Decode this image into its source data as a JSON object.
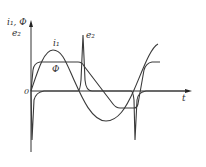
{
  "diagram": {
    "type": "waveform",
    "y_axis_label_line1": "i₁, Φ",
    "y_axis_label_line2": "e₂",
    "x_axis_label": "t",
    "origin_label": "0",
    "curve_labels": {
      "current": "i₁",
      "emf": "e₂",
      "flux": "Φ"
    },
    "colors": {
      "stroke": "#3a3a3a",
      "axis": "#333333",
      "background": "#ffffff"
    },
    "series": [
      {
        "name": "i₁",
        "description": "magnetizing current, peaked sine-like wave"
      },
      {
        "name": "Φ",
        "description": "magnetic flux, flat-topped trapezoidal wave"
      },
      {
        "name": "e₂",
        "description": "secondary EMF, sharp spikes at flux transitions"
      }
    ]
  }
}
